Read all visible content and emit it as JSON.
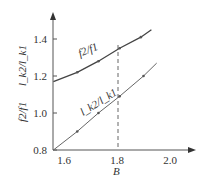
{
  "chart_data": {
    "type": "line",
    "title": "",
    "xlabel": "B",
    "ylabel": "f2/f1   l_k2/l_k1",
    "xlim": [
      1.56,
      2.1
    ],
    "ylim": [
      0.8,
      1.5
    ],
    "xticks": [
      "1.6",
      "1.8",
      "2.0"
    ],
    "yticks": [
      "0.8",
      "1.0",
      "1.2",
      "1.4"
    ],
    "grid": false,
    "reference_line": {
      "x": 1.8,
      "style": "dashed"
    },
    "series": [
      {
        "name": "f2/f1",
        "x": [
          1.56,
          1.65,
          1.73,
          1.81,
          1.89,
          1.93
        ],
        "y": [
          1.17,
          1.22,
          1.28,
          1.35,
          1.41,
          1.45
        ]
      },
      {
        "name": "l_k2/l_k1",
        "x": [
          1.56,
          1.65,
          1.73,
          1.81,
          1.9,
          1.95
        ],
        "y": [
          0.8,
          0.9,
          1.0,
          1.09,
          1.2,
          1.27
        ]
      }
    ],
    "annotations": [
      "f2/f1",
      "l_k2/l_k1"
    ]
  },
  "labels": {
    "x_axis": "B",
    "y_axis_top": "l",
    "y_axis_bottom": "f2/f1",
    "series_upper": "f2/f1",
    "series_lower": "l_k2/l_k1"
  }
}
